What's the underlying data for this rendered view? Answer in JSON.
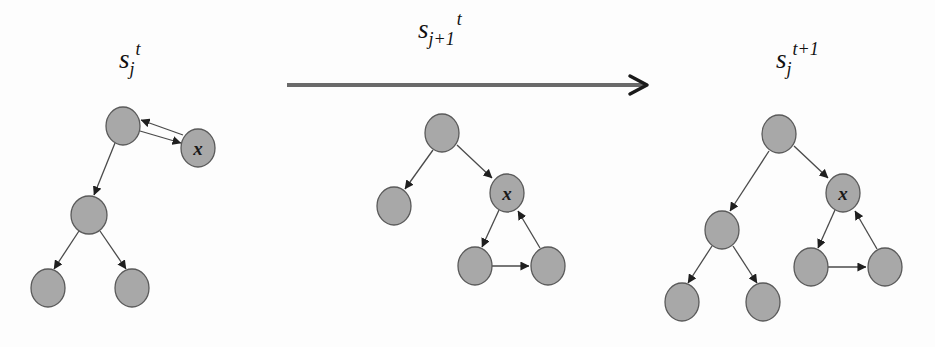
{
  "figure": {
    "states": [
      {
        "id": "left",
        "label": {
          "base": "s",
          "sub": "j",
          "sup": "t"
        },
        "nodes": [
          {
            "id": "L-root",
            "label": ""
          },
          {
            "id": "L-x",
            "label": "x"
          },
          {
            "id": "L-mid",
            "label": ""
          },
          {
            "id": "L-leaf-left",
            "label": ""
          },
          {
            "id": "L-leaf-right",
            "label": ""
          }
        ]
      },
      {
        "id": "middle",
        "label": null,
        "nodes": [
          {
            "id": "M-root",
            "label": ""
          },
          {
            "id": "M-left",
            "label": ""
          },
          {
            "id": "M-x",
            "label": "x"
          },
          {
            "id": "M-bottom-left",
            "label": ""
          },
          {
            "id": "M-bottom-right",
            "label": ""
          }
        ]
      },
      {
        "id": "right",
        "label": {
          "base": "s",
          "sub": "j",
          "sup": "t+1"
        },
        "nodes": [
          {
            "id": "R-root",
            "label": ""
          },
          {
            "id": "R-mid",
            "label": ""
          },
          {
            "id": "R-x",
            "label": "x"
          },
          {
            "id": "R-leaf-left",
            "label": ""
          },
          {
            "id": "R-leaf-right",
            "label": ""
          },
          {
            "id": "R-bottom-left",
            "label": ""
          },
          {
            "id": "R-bottom-right",
            "label": ""
          }
        ]
      }
    ],
    "transition": {
      "label": {
        "base": "s",
        "sub": "j+1",
        "sup": "t"
      },
      "direction": "left-to-right"
    },
    "colors": {
      "node_fill": "#a8a8a8",
      "node_stroke": "#5a5a5a",
      "edge": "#4a4a4a",
      "transition_line": "#6a6a6a",
      "text": "#111111"
    }
  }
}
